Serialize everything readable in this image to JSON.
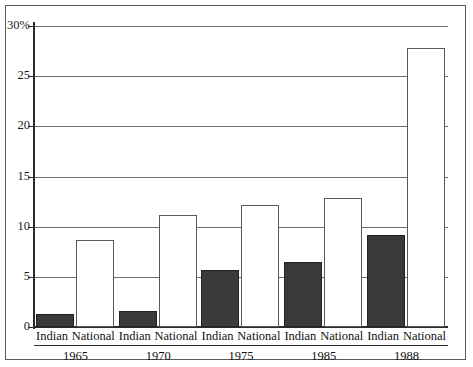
{
  "chart_data": {
    "type": "bar",
    "title": "",
    "xlabel": "",
    "ylabel": "",
    "ylim": [
      0,
      30
    ],
    "grid": true,
    "legend_position": "none",
    "categories": [
      "1965",
      "1970",
      "1975",
      "1985",
      "1988"
    ],
    "series": [
      {
        "name": "Indian",
        "values": [
          1.3,
          1.6,
          5.7,
          6.5,
          9.2
        ]
      },
      {
        "name": "National",
        "values": [
          8.7,
          11.2,
          12.2,
          12.9,
          27.8
        ]
      }
    ],
    "y_ticks": [
      {
        "value": 30,
        "label": "30%"
      },
      {
        "value": 25,
        "label": "25"
      },
      {
        "value": 20,
        "label": "20"
      },
      {
        "value": 15,
        "label": "15"
      },
      {
        "value": 10,
        "label": "10"
      },
      {
        "value": 5,
        "label": "5"
      },
      {
        "value": 0,
        "label": "0"
      }
    ],
    "colors": {
      "indian_bar": "#3a3a3a",
      "national_bar": "#ffffff",
      "bar_outline": "#5a5a5a",
      "axis": "#2b2b2b",
      "gridline": "#6e6e6e",
      "frame": "#5a5a5a",
      "background": "#ffffff",
      "text": "#111111"
    }
  }
}
